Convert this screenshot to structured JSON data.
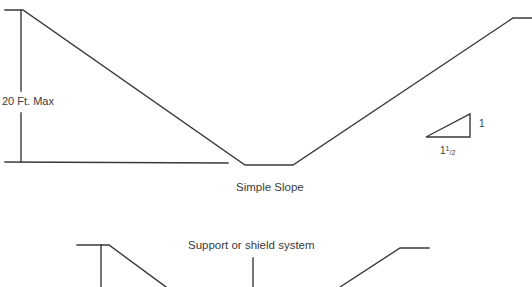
{
  "figure": {
    "top_diagram": {
      "caption": "Simple Slope",
      "dimension_label": "20 Ft. Max",
      "slope_ratio": {
        "rise": "1",
        "run_whole": "1",
        "run_fraction_numerator": "1",
        "run_fraction_slash": "/",
        "run_fraction_denominator": "2"
      }
    },
    "bottom_diagram": {
      "callout_label": "Support or shield system"
    },
    "colors": {
      "line": "#3a3a3a",
      "background": "#ffffff"
    }
  }
}
